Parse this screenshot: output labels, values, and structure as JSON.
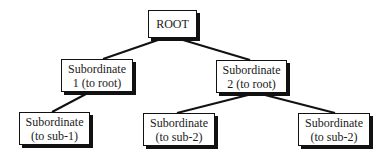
{
  "diagram": {
    "type": "tree",
    "nodes": [
      {
        "id": "root",
        "lines": [
          "ROOT"
        ],
        "box": [
          148,
          10,
          49,
          28
        ]
      },
      {
        "id": "sub1",
        "lines": [
          "Subordinate",
          "1 (to root)"
        ],
        "box": [
          61,
          59,
          72,
          33
        ]
      },
      {
        "id": "sub2",
        "lines": [
          "Subordinate",
          "2 (to root)"
        ],
        "box": [
          216,
          60,
          71,
          33
        ]
      },
      {
        "id": "leaf1",
        "lines": [
          "Subordinate",
          "(to sub-1)"
        ],
        "box": [
          19,
          112,
          71,
          33
        ]
      },
      {
        "id": "leaf2",
        "lines": [
          "Subordinate",
          "(to sub-2)"
        ],
        "box": [
          143,
          113,
          72,
          33
        ]
      },
      {
        "id": "leaf3",
        "lines": [
          "Subordinate",
          "(to sub-2)"
        ],
        "box": [
          298,
          113,
          72,
          33
        ]
      }
    ],
    "edges": [
      {
        "from": "root",
        "to": "sub1"
      },
      {
        "from": "root",
        "to": "sub2"
      },
      {
        "from": "sub1",
        "to": "leaf1"
      },
      {
        "from": "sub2",
        "to": "leaf2"
      },
      {
        "from": "sub2",
        "to": "leaf3"
      }
    ],
    "colors": {
      "line": "#111111",
      "box_fill": "#ffffff",
      "text": "#1a1a1a"
    }
  }
}
